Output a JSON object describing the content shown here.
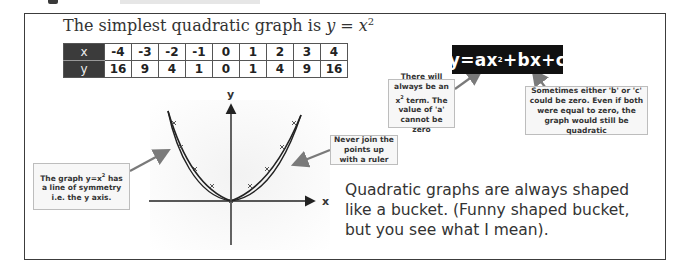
{
  "page": {
    "title_prefix": "The simplest quadratic graph is ",
    "title_math_y": "y",
    "title_math_eq": " = ",
    "title_math_x": "x",
    "title_math_exp": "2"
  },
  "table": {
    "row_x_header": "x",
    "row_y_header": "y",
    "x_values": [
      "-4",
      "-3",
      "-2",
      "-1",
      "0",
      "1",
      "2",
      "3",
      "4"
    ],
    "y_values": [
      "16",
      "9",
      "4",
      "1",
      "0",
      "1",
      "4",
      "9",
      "16"
    ]
  },
  "graph": {
    "x_axis_label": "x",
    "y_axis_label": "y",
    "function": "y = x^2",
    "points": [
      [
        -4,
        16
      ],
      [
        -3,
        9
      ],
      [
        -2,
        4
      ],
      [
        -1,
        1
      ],
      [
        0,
        0
      ],
      [
        1,
        1
      ],
      [
        2,
        4
      ],
      [
        3,
        9
      ],
      [
        4,
        16
      ]
    ]
  },
  "formula": {
    "pre": "y=ax",
    "exp": "2",
    "post": "+bx+c"
  },
  "notes": {
    "symmetry_pre": "The graph y=x",
    "symmetry_exp": "2",
    "symmetry_post": " has a line of symmetry i.e. the y axis.",
    "ruler": "Never join the points up with a ruler",
    "a_term_pre": "There will always be an x",
    "a_term_exp": "2",
    "a_term_post": " term. The value of 'a' cannot be zero",
    "bc_terms": "Sometimes either 'b' or 'c' could be zero. Even if both were equal to zero, the graph would still be quadratic"
  },
  "body": {
    "bucket_text": "Quadratic graphs are always shaped like a bucket. (Funny shaped bucket, but you see what I mean)."
  },
  "colors": {
    "header_cell": "#3b3b3b",
    "formula_bg": "#111111",
    "arrow": "#7a7a7a",
    "note_bg": "#f7f7f7"
  }
}
